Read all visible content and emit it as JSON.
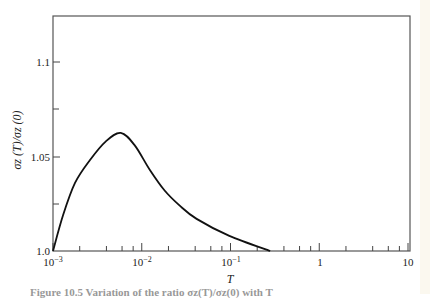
{
  "chart_data": {
    "type": "line",
    "title": "",
    "xlabel": "T",
    "ylabel": "σz (T)/σz (0)",
    "xscale": "log",
    "xlim": [
      0.001,
      10
    ],
    "ylim": [
      1.0,
      1.124
    ],
    "grid": false,
    "legend": null,
    "x_tick_labels": [
      "10^-3",
      "10^-2",
      "10^-1",
      "1",
      "10"
    ],
    "y_tick_labels": [
      "1.0",
      "1.05",
      "1.1"
    ],
    "series": [
      {
        "name": "σz(T)/σz(0)",
        "x": [
          0.001,
          0.0013,
          0.00177,
          0.0026,
          0.00394,
          0.0058,
          0.0083,
          0.0123,
          0.0181,
          0.0268,
          0.0415,
          0.097,
          0.28
        ],
        "y": [
          1.0,
          1.019,
          1.036,
          1.048,
          1.058,
          1.0625,
          1.056,
          1.043,
          1.032,
          1.024,
          1.017,
          1.008,
          1.0
        ]
      }
    ],
    "annotations": []
  },
  "axes": {
    "x_title": "T",
    "y_title_main": "σ",
    "y_title_sub": "z",
    "y_title_full": "σz (T)/σz (0)",
    "x_ticks": [
      {
        "base": "10",
        "exp": "−3"
      },
      {
        "base": "10",
        "exp": "−2"
      },
      {
        "base": "10",
        "exp": "−1"
      },
      {
        "base": "1",
        "exp": ""
      },
      {
        "base": "10",
        "exp": ""
      }
    ],
    "y_ticks": [
      "1.0",
      "1.05",
      "1.1"
    ]
  },
  "caption": "Figure 10.5 Variation of the ratio σz(T)/σz(0) with T"
}
